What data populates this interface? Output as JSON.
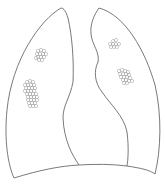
{
  "diagram": {
    "type": "lung-outline-illustration",
    "colors": {
      "background": "#ffffff",
      "outline": "#6a6a6a",
      "nodule": "#9a9a9a"
    },
    "regions": [
      {
        "id": "right-lung",
        "label": ""
      },
      {
        "id": "left-lung",
        "label": ""
      }
    ],
    "nodule_clusters": [
      {
        "lung": "right",
        "position": "upper",
        "cx": 41,
        "cy": 54
      },
      {
        "lung": "right",
        "position": "middle",
        "cx": 31,
        "cy": 95
      },
      {
        "lung": "left",
        "position": "upper",
        "cx": 115,
        "cy": 44
      },
      {
        "lung": "left",
        "position": "middle",
        "cx": 125,
        "cy": 77
      }
    ]
  }
}
